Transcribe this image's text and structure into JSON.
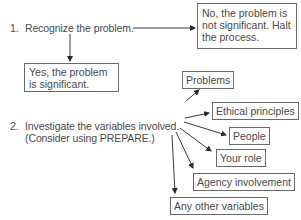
{
  "diagram": {
    "step1": {
      "number": "1.",
      "label": "Recognize the problem."
    },
    "step1_no": "No, the problem is not significant. Halt the process.",
    "step1_yes": "Yes, the problem is significant.",
    "step2": {
      "number": "2.",
      "line1": "Investigate the variables involved.",
      "line2": "(Consider using PREPARE.)"
    },
    "variables": [
      "Problems",
      "Ethical principles",
      "People",
      "Your role",
      "Agency involvement",
      "Any other variables"
    ],
    "colors": {
      "text": "#4a4a4a",
      "line": "#3a3a3a",
      "border": "#6a6a6a"
    }
  }
}
